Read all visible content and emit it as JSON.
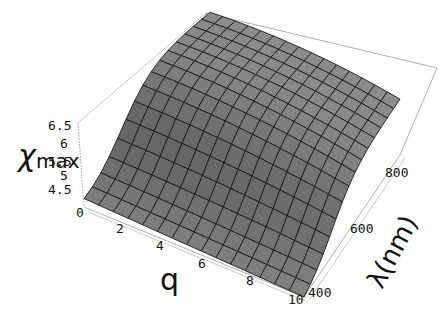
{
  "chart_data": {
    "type": "surface3d",
    "title": "",
    "xlabel": "q",
    "ylabel": "λ(nm)",
    "zlabel": "χmax",
    "zlabel_main": "χ",
    "zlabel_sub": "max",
    "x_ticks": [
      "0",
      "2",
      "4",
      "6",
      "8",
      "10"
    ],
    "y_ticks": [
      "400",
      "600",
      "800"
    ],
    "z_ticks": [
      "4.5",
      "5",
      "5.5",
      "6",
      "6.5"
    ],
    "x_range": [
      0,
      10
    ],
    "y_range": [
      400,
      900
    ],
    "z_range": [
      4.5,
      6.5
    ],
    "grid_mesh": "15x15",
    "surface_color": "#8a8a8a",
    "mesh_color": "#1a1a1a",
    "box": true,
    "sample_values": [
      {
        "q": 0,
        "lambda": 400,
        "chi_max": 4.7
      },
      {
        "q": 0,
        "lambda": 900,
        "chi_max": 6.5
      },
      {
        "q": 10,
        "lambda": 400,
        "chi_max": 4.5
      },
      {
        "q": 10,
        "lambda": 900,
        "chi_max": 6.0
      }
    ]
  }
}
